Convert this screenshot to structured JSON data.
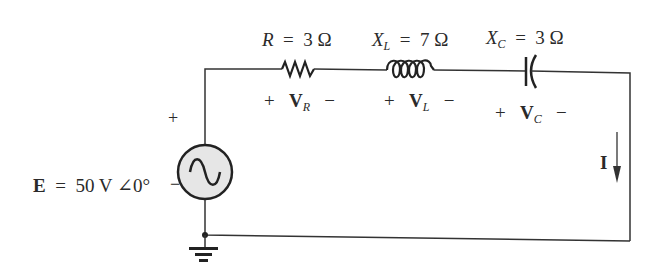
{
  "source": {
    "symbol": "E",
    "equals": "=",
    "magnitude": "50 V",
    "angle_symbol": "∠",
    "angle": "0°",
    "plus": "+",
    "minus": "−",
    "type": "ac-voltage-source"
  },
  "resistor": {
    "symbol": "R",
    "equals": "=",
    "value": "3 Ω",
    "voltage_symbol": "V",
    "voltage_sub": "R",
    "plus": "+",
    "minus": "−"
  },
  "inductor": {
    "symbol": "X",
    "symbol_sub": "L",
    "equals": "=",
    "value": "7 Ω",
    "voltage_symbol": "V",
    "voltage_sub": "L",
    "plus": "+",
    "minus": "−"
  },
  "capacitor": {
    "symbol": "X",
    "symbol_sub": "C",
    "equals": "=",
    "value": "3 Ω",
    "voltage_symbol": "V",
    "voltage_sub": "C",
    "plus": "+",
    "minus": "−"
  },
  "current": {
    "symbol": "I",
    "direction": "down"
  },
  "colors": {
    "wire": "#333333",
    "source_fill": "#e6e6e6",
    "background": "#ffffff"
  }
}
